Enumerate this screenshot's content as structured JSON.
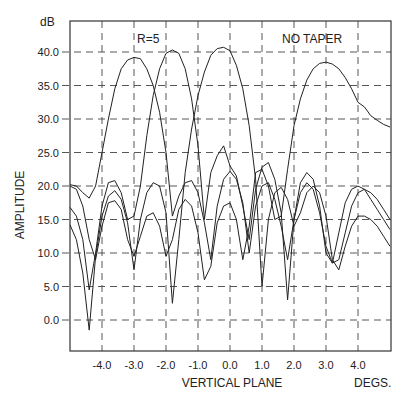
{
  "chart_data": {
    "type": "line",
    "title": "",
    "annotations": [
      "R=5",
      "NO TAPER"
    ],
    "xlabel": "VERTICAL PLANE",
    "xunit": "DEGS.",
    "ylabel": "AMPLITUDE",
    "yunit": "dB",
    "xlim": [
      -5.0,
      5.0
    ],
    "ylim": [
      -3.0,
      45.0
    ],
    "grid": true,
    "legend": "none",
    "x_ticks": [
      -4.0,
      -3.0,
      -2.0,
      -1.0,
      0.0,
      1.0,
      2.0,
      3.0,
      4.0
    ],
    "x_tick_labels": [
      "-4.0",
      "-3.0",
      "-2.0",
      "-1.0",
      "0.0",
      "1.0",
      "2.0",
      "3.0",
      "4.0"
    ],
    "y_ticks": [
      0.0,
      5.0,
      10.0,
      15.0,
      20.0,
      25.0,
      30.0,
      35.0,
      40.0
    ],
    "y_tick_labels": [
      "0.0",
      "5.0",
      "10.0",
      "15.0",
      "20.0",
      "25.0",
      "30.0",
      "35.0",
      "40.0"
    ],
    "series": [
      {
        "name": "beam-1 (peak -2.8 deg)",
        "x": [
          -5.0,
          -4.8,
          -4.6,
          -4.4,
          -4.2,
          -4.0,
          -3.8,
          -3.6,
          -3.4,
          -3.2,
          -3.0,
          -2.8,
          -2.6,
          -2.4,
          -2.2,
          -2.0,
          -1.8,
          -1.6,
          -1.4,
          -1.2,
          -1.0,
          -0.8,
          -0.6,
          -0.4,
          -0.2,
          0.0,
          0.2,
          0.4,
          0.6,
          0.8,
          1.0,
          1.2,
          1.4,
          1.6,
          1.8,
          2.0,
          2.2,
          2.4,
          2.6,
          2.8,
          3.0,
          3.2,
          3.4,
          3.6,
          3.8,
          4.0,
          4.2,
          4.4,
          4.6,
          4.8,
          5.0
        ],
        "values": [
          20.2,
          20.0,
          19.0,
          18.2,
          20.0,
          25.0,
          30.0,
          34.5,
          37.5,
          38.8,
          39.2,
          39.0,
          37.5,
          35.0,
          31.0,
          25.0,
          15.5,
          18.5,
          20.5,
          20.8,
          19.0,
          14.5,
          9.0,
          17.0,
          21.0,
          22.2,
          21.0,
          17.5,
          10.0,
          17.0,
          20.0,
          20.5,
          18.0,
          14.0,
          9.0,
          15.0,
          19.0,
          20.5,
          19.5,
          16.0,
          11.0,
          8.5,
          9.0,
          13.0,
          17.0,
          19.0,
          19.5,
          19.0,
          18.0,
          16.5,
          15.0
        ]
      },
      {
        "name": "beam-2 (peak -1.7 deg)",
        "x": [
          -5.0,
          -4.8,
          -4.6,
          -4.4,
          -4.2,
          -4.0,
          -3.8,
          -3.6,
          -3.4,
          -3.2,
          -3.0,
          -2.8,
          -2.6,
          -2.4,
          -2.2,
          -2.0,
          -1.8,
          -1.6,
          -1.4,
          -1.2,
          -1.0,
          -0.8,
          -0.6,
          -0.4,
          -0.2,
          0.0,
          0.2,
          0.4,
          0.6,
          0.8,
          1.0,
          1.2,
          1.4,
          1.6,
          1.8,
          2.0,
          2.2,
          2.4,
          2.6,
          2.8,
          3.0,
          3.2,
          3.4,
          3.6,
          3.8,
          4.0,
          4.2,
          4.4,
          4.6,
          4.8,
          5.0
        ],
        "values": [
          16.8,
          15.5,
          12.0,
          4.5,
          10.0,
          17.0,
          20.5,
          20.8,
          19.0,
          15.0,
          15.5,
          20.0,
          27.5,
          33.5,
          37.5,
          39.8,
          40.3,
          39.8,
          37.5,
          33.0,
          26.0,
          15.0,
          22.0,
          24.5,
          26.0,
          23.0,
          21.5,
          17.0,
          12.0,
          19.5,
          22.8,
          23.5,
          21.0,
          16.0,
          3.0,
          15.0,
          20.5,
          22.0,
          21.0,
          17.0,
          10.0,
          8.5,
          13.0,
          17.5,
          19.5,
          20.0,
          19.5,
          18.0,
          16.5,
          15.0,
          13.5
        ]
      },
      {
        "name": "beam-3 (peak 0.0 deg)",
        "x": [
          -5.0,
          -4.8,
          -4.6,
          -4.4,
          -4.2,
          -4.0,
          -3.8,
          -3.6,
          -3.4,
          -3.2,
          -3.0,
          -2.8,
          -2.6,
          -2.4,
          -2.2,
          -2.0,
          -1.8,
          -1.6,
          -1.4,
          -1.2,
          -1.0,
          -0.8,
          -0.6,
          -0.4,
          -0.2,
          0.0,
          0.2,
          0.4,
          0.6,
          0.8,
          1.0,
          1.2,
          1.4,
          1.6,
          1.8,
          2.0,
          2.2,
          2.4,
          2.6,
          2.8,
          3.0,
          3.2,
          3.4,
          3.6,
          3.8,
          4.0,
          4.2,
          4.4,
          4.6,
          4.8,
          5.0
        ],
        "values": [
          14.2,
          12.0,
          7.0,
          -1.5,
          9.5,
          15.5,
          18.5,
          19.3,
          18.0,
          14.5,
          7.5,
          15.0,
          19.0,
          20.5,
          20.0,
          16.0,
          2.5,
          12.0,
          22.0,
          28.5,
          33.5,
          37.0,
          39.5,
          40.5,
          40.7,
          40.2,
          38.0,
          34.5,
          29.0,
          21.0,
          5.0,
          15.0,
          19.0,
          19.8,
          18.0,
          14.0,
          16.0,
          19.0,
          20.0,
          19.0,
          15.5,
          9.0,
          7.5,
          11.0,
          14.0,
          15.5,
          15.5,
          15.0,
          14.0,
          12.5,
          11.0
        ]
      },
      {
        "name": "beam-4 (peak 3.1 deg)",
        "x": [
          -5.0,
          -4.8,
          -4.6,
          -4.4,
          -4.2,
          -4.0,
          -3.8,
          -3.6,
          -3.4,
          -3.2,
          -3.0,
          -2.8,
          -2.6,
          -2.4,
          -2.2,
          -2.0,
          -1.8,
          -1.6,
          -1.4,
          -1.2,
          -1.0,
          -0.8,
          -0.6,
          -0.4,
          -0.2,
          0.0,
          0.2,
          0.4,
          0.6,
          0.8,
          1.0,
          1.2,
          1.4,
          1.6,
          1.8,
          2.0,
          2.2,
          2.4,
          2.6,
          2.8,
          3.0,
          3.2,
          3.4,
          3.6,
          3.8,
          4.0,
          4.2,
          4.4,
          4.6,
          4.8,
          5.0
        ],
        "values": [
          20.0,
          19.5,
          17.0,
          12.0,
          9.0,
          14.0,
          17.5,
          17.8,
          16.5,
          12.0,
          9.5,
          12.5,
          15.5,
          16.0,
          14.0,
          9.5,
          12.0,
          16.5,
          18.0,
          17.0,
          13.0,
          6.0,
          8.0,
          14.5,
          17.0,
          17.5,
          15.0,
          9.0,
          14.0,
          22.0,
          22.5,
          20.0,
          15.0,
          15.5,
          22.5,
          29.0,
          33.0,
          35.8,
          37.5,
          38.3,
          38.5,
          38.2,
          37.5,
          36.2,
          34.5,
          32.5,
          31.8,
          30.5,
          29.8,
          29.2,
          28.8
        ]
      }
    ]
  },
  "labels": {
    "annotation_r": "R=5",
    "annotation_taper": "NO TAPER",
    "y_unit": "dB",
    "y_axis_title": "AMPLITUDE",
    "x_axis_title": "VERTICAL PLANE",
    "x_unit": "DEGS."
  }
}
